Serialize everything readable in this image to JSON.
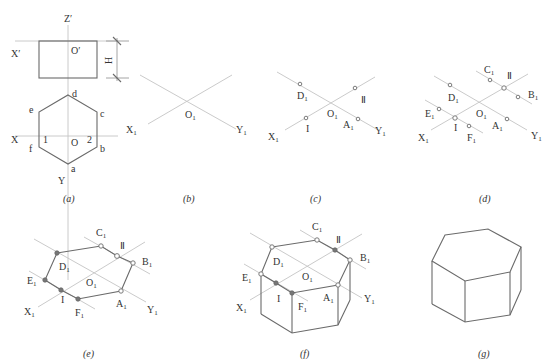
{
  "figure": {
    "panels": [
      {
        "id": "a",
        "caption": "(a)"
      },
      {
        "id": "b",
        "caption": "(b)"
      },
      {
        "id": "c",
        "caption": "(c)"
      },
      {
        "id": "d",
        "caption": "(d)"
      },
      {
        "id": "e",
        "caption": "(e)"
      },
      {
        "id": "f",
        "caption": "(f)"
      },
      {
        "id": "g",
        "caption": "(g)"
      }
    ],
    "panel_a": {
      "front_view_labels": {
        "z": "Z",
        "x": "X",
        "origin": "O",
        "height": "H",
        "prime": "′"
      },
      "top_view_labels": {
        "x": "X",
        "y": "Y",
        "origin": "O",
        "vertices": [
          "a",
          "b",
          "c",
          "d",
          "e",
          "f"
        ],
        "points": [
          "1",
          "2"
        ]
      }
    },
    "axis_labels": {
      "x": "X",
      "y": "Y",
      "origin": "O",
      "sub": "1"
    },
    "iso_points": {
      "A": "A",
      "B": "B",
      "C": "C",
      "D": "D",
      "E": "E",
      "F": "F",
      "I": "I",
      "II": "Ⅱ",
      "sub": "1"
    }
  }
}
